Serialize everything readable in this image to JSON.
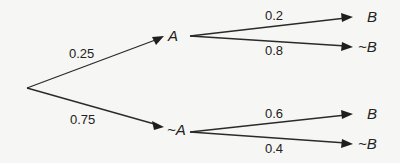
{
  "diagram": {
    "type": "probability-tree",
    "root": {
      "branches": [
        {
          "prob": "0.25",
          "label": "A",
          "branches": [
            {
              "prob": "0.2",
              "label": "B"
            },
            {
              "prob": "0.8",
              "label": "~B"
            }
          ]
        },
        {
          "prob": "0.75",
          "label": "~A",
          "branches": [
            {
              "prob": "0.6",
              "label": "B"
            },
            {
              "prob": "0.4",
              "label": "~B"
            }
          ]
        }
      ]
    }
  }
}
